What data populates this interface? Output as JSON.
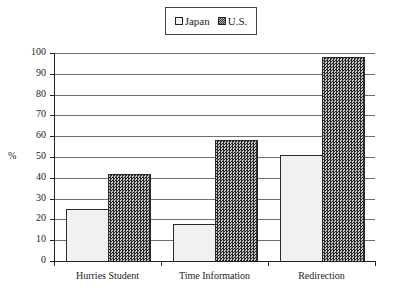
{
  "legend": {
    "items": [
      {
        "label": "Japan",
        "icon": "light-square-swatch"
      },
      {
        "label": "U.S.",
        "icon": "crosshatch-square-swatch"
      }
    ]
  },
  "axes": {
    "ylabel": "%",
    "yticks": [
      "0",
      "10",
      "20",
      "30",
      "40",
      "50",
      "60",
      "70",
      "80",
      "90",
      "100"
    ],
    "xticks": [
      "Hurries Student",
      "Time Information",
      "Redirection"
    ]
  },
  "colors": {
    "japan_fill": "#f1f1f1",
    "us_fill_dark": "#2b2b2b",
    "us_fill_light": "#c4c4c4",
    "gridline": "#6f6f6f",
    "axis": "#222222"
  },
  "chart_data": {
    "type": "bar",
    "title": "",
    "categories": [
      "Hurries Student",
      "Time Information",
      "Redirection"
    ],
    "series": [
      {
        "name": "Japan",
        "values": [
          25,
          18,
          51
        ]
      },
      {
        "name": "U.S.",
        "values": [
          42,
          58,
          98
        ]
      }
    ],
    "xlabel": "",
    "ylabel": "%",
    "ylim": [
      0,
      100
    ],
    "ytick_step": 10,
    "grid": true,
    "legend_position": "top-center"
  }
}
